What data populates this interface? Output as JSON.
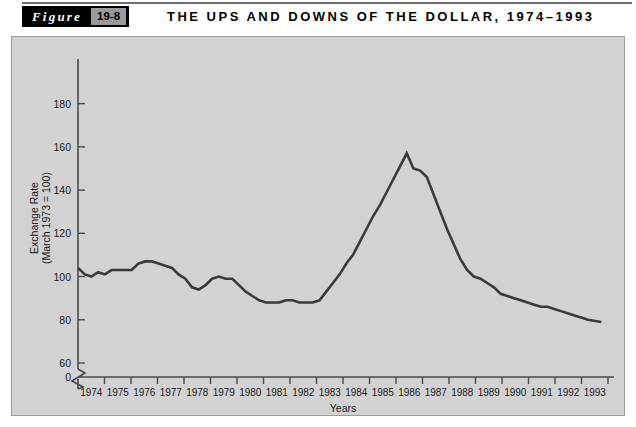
{
  "figure": {
    "label_word": "Figure",
    "number": "19-8",
    "title": "THE UPS AND DOWNS OF THE DOLLAR, 1974–1993"
  },
  "chart_data": {
    "type": "line",
    "title": "THE UPS AND DOWNS OF THE DOLLAR, 1974–1993",
    "xlabel": "Years",
    "ylabel": "Exchange Rate (March 1973 = 100)",
    "ylabel_line1": "Exchange Rate",
    "ylabel_line2": "(March 1973 = 100)",
    "ylim": [
      0,
      190
    ],
    "y_ticks": [
      0,
      60,
      80,
      100,
      120,
      140,
      160,
      180
    ],
    "y_axis_break": true,
    "y_break_between": [
      0,
      60
    ],
    "grid": false,
    "legend": "none",
    "line_color": "#3a3a3a",
    "panel_color": "#d2d2d2",
    "xlim": [
      1974,
      1993.75
    ],
    "x_ticks": [
      1974,
      1975,
      1976,
      1977,
      1978,
      1979,
      1980,
      1981,
      1982,
      1983,
      1984,
      1985,
      1986,
      1987,
      1988,
      1989,
      1990,
      1991,
      1992,
      1993
    ],
    "x_tick_labels": [
      "1974",
      "1975",
      "1976",
      "1977",
      "1978",
      "1979",
      "1980",
      "1981",
      "1982",
      "1983",
      "1984",
      "1985",
      "1986",
      "1987",
      "1988",
      "1989",
      "1990",
      "1991",
      "1992",
      "1993"
    ],
    "series": [
      {
        "name": "Trade-weighted dollar exchange rate",
        "x": [
          1974.0,
          1974.25,
          1974.5,
          1974.75,
          1975.0,
          1975.25,
          1975.5,
          1975.75,
          1976.0,
          1976.25,
          1976.5,
          1976.75,
          1977.0,
          1977.25,
          1977.5,
          1977.75,
          1978.0,
          1978.25,
          1978.5,
          1978.75,
          1979.0,
          1979.25,
          1979.5,
          1979.75,
          1980.0,
          1980.25,
          1980.5,
          1980.75,
          1981.0,
          1981.25,
          1981.5,
          1981.75,
          1982.0,
          1982.25,
          1982.5,
          1982.75,
          1983.0,
          1983.25,
          1983.5,
          1983.75,
          1984.0,
          1984.25,
          1984.5,
          1984.75,
          1985.0,
          1985.25,
          1985.5,
          1985.75,
          1986.0,
          1986.25,
          1986.5,
          1986.75,
          1987.0,
          1987.25,
          1987.5,
          1987.75,
          1988.0,
          1988.25,
          1988.5,
          1988.75,
          1989.0,
          1989.25,
          1989.5,
          1989.75,
          1990.0,
          1990.25,
          1990.5,
          1990.75,
          1991.0,
          1991.25,
          1991.5,
          1991.75,
          1992.0,
          1992.25,
          1992.5,
          1992.75,
          1993.0,
          1993.5
        ],
        "values": [
          104,
          101,
          100,
          102,
          101,
          103,
          103,
          103,
          103,
          106,
          107,
          107,
          106,
          105,
          104,
          101,
          99,
          95,
          94,
          96,
          99,
          100,
          99,
          99,
          96,
          93,
          91,
          89,
          88,
          88,
          88,
          89,
          89,
          88,
          88,
          88,
          89,
          93,
          97,
          101,
          106,
          110,
          116,
          122,
          128,
          133,
          139,
          145,
          151,
          157,
          150,
          149,
          146,
          138,
          130,
          122,
          115,
          108,
          103,
          100,
          99,
          97,
          95,
          92,
          91,
          90,
          89,
          88,
          87,
          86,
          86,
          85,
          84,
          83,
          82,
          81,
          80,
          79
        ]
      }
    ]
  }
}
